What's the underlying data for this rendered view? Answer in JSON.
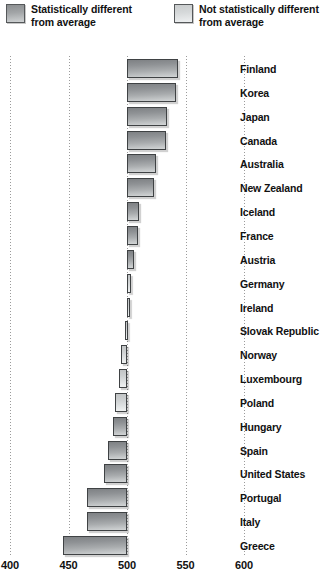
{
  "legend": {
    "items": [
      {
        "label": "Statistically different\nfrom average",
        "swatch": "dark",
        "color": "#9a9d9f"
      },
      {
        "label": "Not statistically different\nfrom average",
        "swatch": "light",
        "color": "#d8dbdc"
      }
    ]
  },
  "axis": {
    "ticks": [
      "400",
      "450",
      "500",
      "550",
      "600"
    ],
    "tick_values": [
      400,
      450,
      500,
      550,
      600
    ],
    "baseline": 500
  },
  "chart_data": {
    "type": "bar",
    "orientation": "horizontal",
    "title": "",
    "xlabel": "",
    "ylabel": "",
    "xlim": [
      400,
      600
    ],
    "baseline": 500,
    "grid": true,
    "legend_position": "top",
    "categories": [
      "Finland",
      "Korea",
      "Japan",
      "Canada",
      "Australia",
      "New Zealand",
      "Iceland",
      "France",
      "Austria",
      "Germany",
      "Ireland",
      "Slovak Republic",
      "Norway",
      "Luxembourg",
      "Poland",
      "Hungary",
      "Spain",
      "United States",
      "Portugal",
      "Italy",
      "Greece"
    ],
    "values": [
      544,
      542,
      534,
      533,
      525,
      523,
      510,
      509,
      506,
      503,
      502,
      498,
      495,
      493,
      490,
      488,
      484,
      480,
      466,
      466,
      445
    ],
    "significance": [
      "dark",
      "dark",
      "dark",
      "dark",
      "dark",
      "dark",
      "dark",
      "dark",
      "dark",
      "light",
      "light",
      "light",
      "light",
      "light",
      "light",
      "dark",
      "dark",
      "dark",
      "dark",
      "dark",
      "dark"
    ],
    "series": [
      {
        "name": "Statistically different from average",
        "values": [
          544,
          542,
          534,
          533,
          525,
          523,
          510,
          509,
          506,
          null,
          null,
          null,
          null,
          null,
          null,
          488,
          484,
          480,
          466,
          466,
          445
        ]
      },
      {
        "name": "Not statistically different from average",
        "values": [
          null,
          null,
          null,
          null,
          null,
          null,
          null,
          null,
          null,
          503,
          502,
          498,
          495,
          493,
          490,
          null,
          null,
          null,
          null,
          null,
          null
        ]
      }
    ]
  }
}
